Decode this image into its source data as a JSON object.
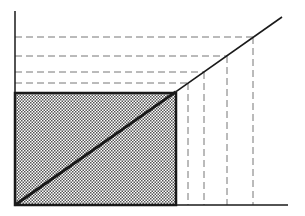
{
  "diagram": {
    "type": "geometric-graph",
    "colors": {
      "line": "#1a1a1a",
      "dash": "#777777",
      "fill_dot": "#555555",
      "background": "#ffffff"
    },
    "axes": {
      "origin": [
        15,
        205
      ],
      "y_top": 11,
      "x_end": 288
    },
    "shaded_rectangle": {
      "x": 15,
      "y": 93,
      "width": 161,
      "height": 112
    },
    "diagonal": {
      "from": [
        15,
        205
      ],
      "to": [
        282,
        17
      ]
    },
    "projection_points": [
      {
        "x": 188,
        "y": 83
      },
      {
        "x": 204,
        "y": 72
      },
      {
        "x": 227,
        "y": 56
      },
      {
        "x": 253,
        "y": 37
      }
    ]
  }
}
